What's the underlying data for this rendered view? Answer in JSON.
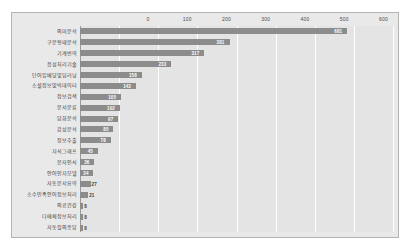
{
  "chart_data": {
    "type": "bar",
    "orientation": "horizontal",
    "title": "",
    "subtitle": "",
    "xlabel": "",
    "ylabel": "",
    "xlim": [
      0,
      800
    ],
    "xticks": [
      0,
      100,
      200,
      300,
      400,
      500,
      600,
      700,
      800
    ],
    "xtick_labels": [
      "0",
      "100",
      "200",
      "300",
      "400",
      "500",
      "600",
      "700",
      "800"
    ],
    "grid": true,
    "legend": null,
    "categories": [
      "의미분석",
      "구문형태분석",
      "기계번역",
      "음성처리기술",
      "단어임베딩및딥러닝",
      "소셜정보및빅데이터",
      "정보검색",
      "문서분류",
      "담화분석",
      "감성분석",
      "정보추출",
      "지식그래프",
      "문자인식",
      "언어인지모델",
      "자동문서요약",
      "소수민족언어정보처리",
      "의료건강",
      "다매체정보처리",
      "자동질의응답"
    ],
    "values": [
      681,
      381,
      317,
      233,
      158,
      143,
      105,
      102,
      97,
      85,
      78,
      45,
      36,
      34,
      27,
      21,
      8,
      8,
      8
    ],
    "value_labels": [
      "681",
      "381",
      "317",
      "233",
      "158",
      "143",
      "105",
      "102",
      "97",
      "85",
      "78",
      "45",
      "36",
      "34",
      "27",
      "21",
      "8",
      "8",
      "8"
    ],
    "bar_color": "#8c8c8c",
    "plot_background": "#e4e4e4",
    "frame_background": "#e9e9e9",
    "grid_color": "#ffffff",
    "axis_color": "#9a9a9a",
    "label_color": "#3c3c3c",
    "value_label_color": "#ffffff"
  }
}
